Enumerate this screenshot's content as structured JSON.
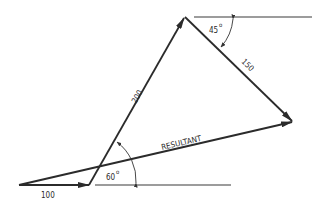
{
  "diagram": {
    "type": "vector-addition",
    "vectors": [
      {
        "id": "v100",
        "label": "100",
        "magnitude": 100,
        "angle_deg": 0
      },
      {
        "id": "v200",
        "label": "200",
        "magnitude": 200,
        "angle_deg": 60
      },
      {
        "id": "v150",
        "label": "150",
        "magnitude": 150,
        "angle_deg": -45
      },
      {
        "id": "resultant",
        "label": "RESULTANT"
      }
    ],
    "angles": [
      {
        "id": "angle-60",
        "label": "60",
        "unit": "o"
      },
      {
        "id": "angle-45",
        "label": "45",
        "unit": "o"
      }
    ],
    "colors": {
      "stroke": "#2b2b2b",
      "background": "#ffffff"
    }
  }
}
